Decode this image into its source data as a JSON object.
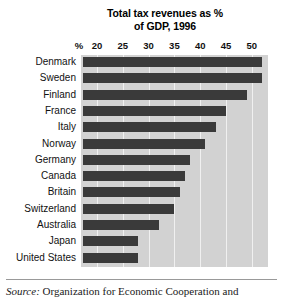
{
  "chart_data": {
    "type": "bar",
    "orientation": "horizontal",
    "title": "Total tax revenues as % of GDP, 1996",
    "title_lines": [
      "Total tax revenues as %",
      "of GDP, 1996"
    ],
    "xlabel": "%",
    "ylabel": "",
    "xlim": [
      15,
      53
    ],
    "xticks": [
      20,
      25,
      30,
      35,
      40,
      45,
      50
    ],
    "xtick_labels": [
      "20",
      "25",
      "30",
      "35",
      "40",
      "45",
      "50"
    ],
    "axis_unit_label": "%",
    "grid": true,
    "grid_axis": "x",
    "legend": false,
    "categories": [
      "Denmark",
      "Sweden",
      "Finland",
      "France",
      "Italy",
      "Norway",
      "Germany",
      "Canada",
      "Britain",
      "Switzerland",
      "Australia",
      "Japan",
      "United States"
    ],
    "values": [
      52,
      52,
      49,
      45,
      43,
      41,
      38,
      37,
      36,
      35,
      32,
      28,
      28
    ],
    "bar_color": "#3a3a3a",
    "plot_background": "#d2d2d2",
    "gridline_color": "#f0f0f0"
  },
  "footer": {
    "source_label": "Source:",
    "source_text": "Organization for Economic Cooperation and"
  }
}
